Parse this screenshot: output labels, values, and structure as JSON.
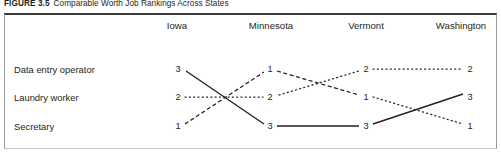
{
  "caption": {
    "figure_number": "FIGURE 3.5",
    "title": "Comparable Worth Job Rankings Across States"
  },
  "chart_data": {
    "type": "line",
    "title": "Comparable Worth Job Rankings Across States",
    "xlabel": "",
    "ylabel": "",
    "categories": [
      "Iowa",
      "Minnesota",
      "Vermont",
      "Washington"
    ],
    "ylim": [
      3,
      1
    ],
    "y_inverted": true,
    "grid": false,
    "legend": "none",
    "value_labels_shown": true,
    "series": [
      {
        "name": "Data entry operator",
        "values": [
          3,
          1,
          2,
          2
        ],
        "line_styles": [
          "solid",
          "dashed",
          "dotted"
        ]
      },
      {
        "name": "Laundry worker",
        "values": [
          2,
          2,
          1,
          3
        ],
        "line_styles": [
          "dotted",
          "dotted",
          "solid"
        ]
      },
      {
        "name": "Secretary",
        "values": [
          1,
          3,
          3,
          1
        ],
        "line_styles": [
          "dashed",
          "solid",
          "dotted"
        ]
      }
    ]
  },
  "columns": [
    {
      "label": "Iowa",
      "x": 177
    },
    {
      "label": "Minnesota",
      "x": 271
    },
    {
      "label": "Vermont",
      "x": 366
    },
    {
      "label": "Washington",
      "x": 461
    }
  ],
  "rows": [
    {
      "label": "Data entry operator",
      "y": 69
    },
    {
      "label": "Laundry worker",
      "y": 97
    },
    {
      "label": "Secretary",
      "y": 126
    }
  ],
  "points": [
    {
      "series": "Data entry operator",
      "state": "Iowa",
      "value": "3",
      "x": 178,
      "y": 69
    },
    {
      "series": "Data entry operator",
      "state": "Minnesota",
      "value": "1",
      "x": 270,
      "y": 69
    },
    {
      "series": "Data entry operator",
      "state": "Vermont",
      "value": "2",
      "x": 366,
      "y": 69
    },
    {
      "series": "Data entry operator",
      "state": "Washington",
      "value": "2",
      "x": 470,
      "y": 69
    },
    {
      "series": "Laundry worker",
      "state": "Iowa",
      "value": "2",
      "x": 178,
      "y": 97
    },
    {
      "series": "Laundry worker",
      "state": "Minnesota",
      "value": "2",
      "x": 270,
      "y": 97
    },
    {
      "series": "Laundry worker",
      "state": "Vermont",
      "value": "1",
      "x": 366,
      "y": 97
    },
    {
      "series": "Laundry worker",
      "state": "Washington",
      "value": "3",
      "x": 470,
      "y": 97
    },
    {
      "series": "Secretary",
      "state": "Iowa",
      "value": "1",
      "x": 178,
      "y": 126
    },
    {
      "series": "Secretary",
      "state": "Minnesota",
      "value": "3",
      "x": 270,
      "y": 126
    },
    {
      "series": "Secretary",
      "state": "Vermont",
      "value": "3",
      "x": 366,
      "y": 126
    },
    {
      "series": "Secretary",
      "state": "Washington",
      "value": "1",
      "x": 470,
      "y": 126
    }
  ],
  "segments": [
    {
      "from": "Iowa-3",
      "to": "Minnesota-3",
      "style": "solid",
      "x1": 186,
      "y1": 71,
      "x2": 264,
      "y2": 124
    },
    {
      "from": "Minnesota-3",
      "to": "Vermont-3",
      "style": "solid",
      "x1": 277,
      "y1": 126,
      "x2": 359,
      "y2": 126
    },
    {
      "from": "Vermont-3",
      "to": "Washington-3",
      "style": "solid",
      "x1": 373,
      "y1": 124,
      "x2": 463,
      "y2": 94
    },
    {
      "from": "Iowa-1",
      "to": "Minnesota-1",
      "style": "dashed",
      "x1": 185,
      "y1": 124,
      "x2": 264,
      "y2": 72
    },
    {
      "from": "Minnesota-1",
      "to": "Vermont-1",
      "style": "dashed",
      "x1": 277,
      "y1": 71,
      "x2": 359,
      "y2": 95
    },
    {
      "from": "Vermont-1",
      "to": "Washington-1",
      "style": "dotted",
      "x1": 373,
      "y1": 97,
      "x2": 463,
      "y2": 124
    },
    {
      "from": "Iowa-2",
      "to": "Minnesota-2",
      "style": "dotted",
      "x1": 185,
      "y1": 97,
      "x2": 263,
      "y2": 97
    },
    {
      "from": "Minnesota-2",
      "to": "Vermont-2",
      "style": "dotted",
      "x1": 279,
      "y1": 95,
      "x2": 359,
      "y2": 71
    },
    {
      "from": "Vermont-2",
      "to": "Washington-2",
      "style": "dotted",
      "x1": 373,
      "y1": 69,
      "x2": 463,
      "y2": 69
    }
  ],
  "colors": {
    "ink": "#231f20",
    "frame_top": "#3b3b3b",
    "frame_side": "#9a9a9a",
    "background": "#ffffff"
  }
}
